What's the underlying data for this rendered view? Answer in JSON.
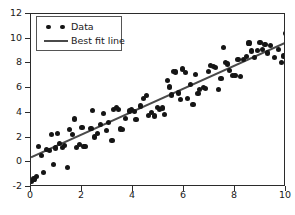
{
  "chart_data": {
    "type": "scatter",
    "title": "",
    "xlabel": "",
    "ylabel": "",
    "xlim": [
      0,
      10
    ],
    "ylim": [
      -2,
      12
    ],
    "grid": false,
    "legend_position": "upper left",
    "xticks": [
      "0",
      "2",
      "4",
      "6",
      "8",
      "10"
    ],
    "xtick_values": [
      0,
      2,
      4,
      6,
      8,
      10
    ],
    "yticks": [
      "-2",
      "0",
      "2",
      "4",
      "6",
      "8",
      "10",
      "12"
    ],
    "ytick_values": [
      -2,
      0,
      2,
      4,
      6,
      8,
      10,
      12
    ],
    "series": [
      {
        "name": "Data",
        "type": "scatter",
        "marker": "o",
        "color": "#151515",
        "points": [
          [
            0.02,
            -1.55
          ],
          [
            0.12,
            -1.35
          ],
          [
            0.22,
            -1.15
          ],
          [
            0.3,
            1.25
          ],
          [
            0.42,
            0.55
          ],
          [
            0.5,
            -0.85
          ],
          [
            0.62,
            1.05
          ],
          [
            0.72,
            0.95
          ],
          [
            0.8,
            2.25
          ],
          [
            0.88,
            -0.15
          ],
          [
            0.95,
            1.15
          ],
          [
            1.05,
            2.3
          ],
          [
            1.12,
            1.5
          ],
          [
            1.22,
            1.2
          ],
          [
            1.3,
            1.35
          ],
          [
            1.42,
            -0.45
          ],
          [
            1.5,
            2.65
          ],
          [
            1.62,
            2.25
          ],
          [
            1.7,
            3.5
          ],
          [
            1.8,
            1.2
          ],
          [
            1.9,
            1.45
          ],
          [
            2.0,
            2.8
          ],
          [
            2.05,
            1.25
          ],
          [
            2.12,
            1.3
          ],
          [
            2.35,
            2.75
          ],
          [
            2.42,
            4.2
          ],
          [
            2.5,
            2.05
          ],
          [
            2.6,
            2.3
          ],
          [
            2.72,
            3.05
          ],
          [
            2.85,
            3.95
          ],
          [
            2.95,
            2.55
          ],
          [
            3.05,
            3.25
          ],
          [
            3.18,
            1.75
          ],
          [
            3.25,
            4.25
          ],
          [
            3.35,
            4.45
          ],
          [
            3.42,
            4.3
          ],
          [
            3.52,
            2.7
          ],
          [
            3.6,
            2.65
          ],
          [
            3.72,
            3.55
          ],
          [
            3.85,
            4.15
          ],
          [
            3.95,
            4.25
          ],
          [
            4.05,
            4.1
          ],
          [
            4.12,
            3.45
          ],
          [
            4.3,
            4.55
          ],
          [
            4.42,
            5.15
          ],
          [
            4.52,
            5.4
          ],
          [
            4.62,
            3.8
          ],
          [
            4.72,
            4.05
          ],
          [
            4.85,
            3.75
          ],
          [
            4.95,
            4.45
          ],
          [
            5.05,
            4.25
          ],
          [
            5.15,
            4.4
          ],
          [
            5.25,
            3.85
          ],
          [
            5.35,
            6.65
          ],
          [
            5.42,
            6.1
          ],
          [
            5.5,
            5.45
          ],
          [
            5.6,
            7.35
          ],
          [
            5.68,
            7.3
          ],
          [
            5.78,
            5.6
          ],
          [
            5.85,
            5.05
          ],
          [
            5.95,
            7.55
          ],
          [
            6.05,
            7.25
          ],
          [
            6.15,
            5.15
          ],
          [
            6.25,
            6.3
          ],
          [
            6.35,
            4.65
          ],
          [
            6.45,
            7.1
          ],
          [
            6.55,
            5.55
          ],
          [
            6.62,
            5.9
          ],
          [
            6.75,
            6.05
          ],
          [
            6.85,
            6.0
          ],
          [
            6.95,
            7.35
          ],
          [
            7.05,
            7.8
          ],
          [
            7.15,
            7.75
          ],
          [
            7.22,
            7.7
          ],
          [
            7.35,
            5.9
          ],
          [
            7.45,
            6.75
          ],
          [
            7.55,
            9.3
          ],
          [
            7.62,
            8.1
          ],
          [
            7.7,
            7.95
          ],
          [
            7.8,
            7.45
          ],
          [
            7.9,
            7.05
          ],
          [
            8.0,
            7.05
          ],
          [
            8.12,
            8.35
          ],
          [
            8.22,
            6.95
          ],
          [
            8.32,
            8.3
          ],
          [
            8.45,
            8.55
          ],
          [
            8.55,
            9.65
          ],
          [
            8.65,
            9.0
          ],
          [
            8.78,
            8.45
          ],
          [
            8.88,
            9.05
          ],
          [
            8.98,
            9.7
          ],
          [
            9.08,
            9.1
          ],
          [
            9.18,
            9.55
          ],
          [
            9.28,
            8.85
          ],
          [
            9.4,
            9.45
          ],
          [
            9.55,
            8.45
          ],
          [
            9.7,
            9.1
          ],
          [
            9.82,
            8.05
          ],
          [
            9.9,
            8.6
          ],
          [
            9.98,
            10.4
          ]
        ]
      },
      {
        "name": "Best fit line",
        "type": "line",
        "color": "#4a4a4a",
        "linewidth": 2.0,
        "endpoints": [
          [
            0,
            0.4
          ],
          [
            10,
            9.7
          ]
        ],
        "slope": 0.93,
        "intercept": 0.4
      }
    ]
  },
  "legend": {
    "items": [
      {
        "label": "Data",
        "handle": "two-dots"
      },
      {
        "label": "Best fit line",
        "handle": "line"
      }
    ]
  }
}
